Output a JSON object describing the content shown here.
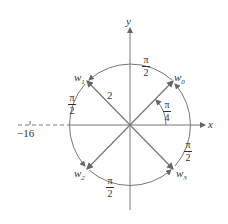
{
  "diagram": {
    "axes": {
      "x_label": "x",
      "y_label": "y",
      "tick_label": "−16"
    },
    "vectors": [
      {
        "name": "w0",
        "label": "w",
        "sub": "0"
      },
      {
        "name": "w1",
        "label": "w",
        "sub": "1"
      },
      {
        "name": "w2",
        "label": "w",
        "sub": "2"
      },
      {
        "name": "w3",
        "label": "w",
        "sub": "3"
      }
    ],
    "modulus_label": "2",
    "angle_label": {
      "num": "π",
      "den": "4"
    },
    "arc_labels": [
      {
        "num": "π",
        "den": "2"
      },
      {
        "num": "π",
        "den": "2"
      },
      {
        "num": "π",
        "den": "2"
      },
      {
        "num": "π",
        "den": "2"
      }
    ],
    "colors": {
      "line": "#777777",
      "text": "#333333"
    }
  }
}
